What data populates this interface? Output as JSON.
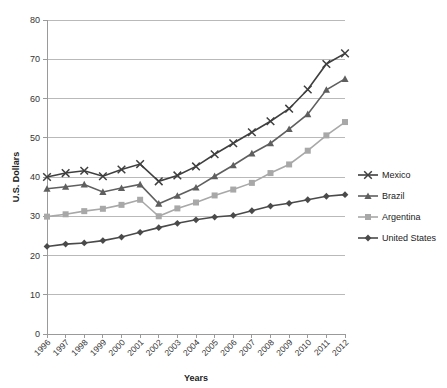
{
  "chart_data": {
    "type": "line",
    "title": "",
    "xlabel": "Years",
    "ylabel": "U.S. Dollars",
    "ylim": [
      0,
      80
    ],
    "yticks": [
      0,
      10,
      20,
      30,
      40,
      50,
      60,
      70,
      80
    ],
    "grid": true,
    "legend_position": "right",
    "categories": [
      "1996",
      "1997",
      "1998",
      "1999",
      "2000",
      "2001",
      "2002",
      "2003",
      "2004",
      "2005",
      "2006",
      "2007",
      "2008",
      "2009",
      "2010",
      "2011",
      "2012"
    ],
    "series": [
      {
        "name": "Mexico",
        "marker": "x",
        "color": "#3f3f3f",
        "values": [
          40.0,
          41.0,
          41.6,
          40.2,
          41.9,
          43.3,
          38.9,
          40.4,
          42.7,
          45.8,
          48.6,
          51.4,
          54.2,
          57.4,
          62.3,
          68.8,
          71.5
        ]
      },
      {
        "name": "Brazil",
        "marker": "triangle",
        "color": "#5f5f5f",
        "values": [
          37.0,
          37.5,
          38.1,
          36.2,
          37.2,
          38.1,
          33.2,
          35.2,
          37.3,
          40.2,
          43.0,
          46.0,
          48.6,
          52.2,
          56.0,
          62.2,
          65.0
        ]
      },
      {
        "name": "Argentina",
        "marker": "square",
        "color": "#a8a8a8",
        "values": [
          29.9,
          30.5,
          31.3,
          31.9,
          32.9,
          34.2,
          30.0,
          32.0,
          33.5,
          35.3,
          36.8,
          38.5,
          41.0,
          43.2,
          46.7,
          50.6,
          54.0
        ]
      },
      {
        "name": "United States",
        "marker": "diamond",
        "color": "#4a4a4a",
        "values": [
          22.3,
          22.9,
          23.2,
          23.8,
          24.7,
          25.9,
          27.1,
          28.2,
          29.1,
          29.8,
          30.2,
          31.4,
          32.6,
          33.3,
          34.2,
          35.1,
          35.5
        ]
      }
    ]
  }
}
